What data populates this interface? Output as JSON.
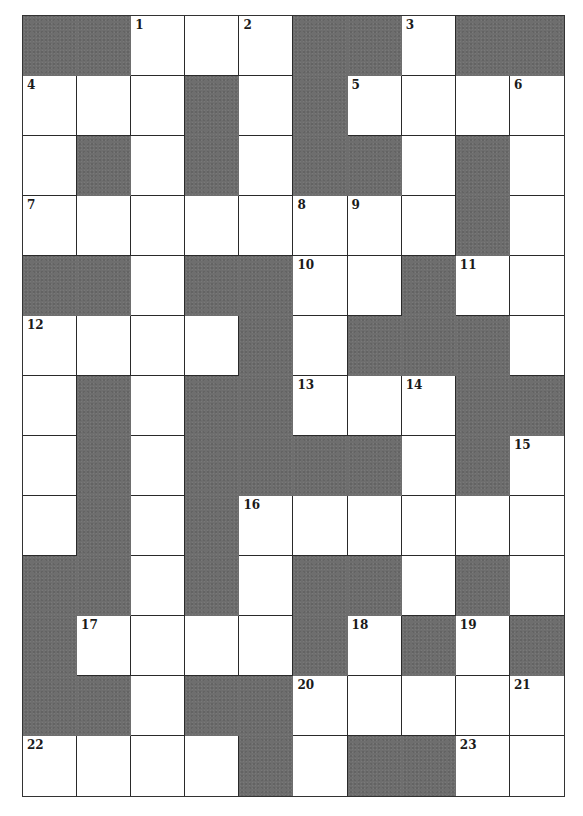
{
  "puzzle": {
    "type": "crossword",
    "columns": 10,
    "rows": 13,
    "colors": {
      "block": "#6e6e6e",
      "open": "#ffffff",
      "line": "#2a2a2a",
      "number": "#1a1a1a"
    },
    "legend": "# = black square, . = open square, number = numbered open square",
    "grid": [
      [
        "#",
        "#",
        "1",
        ".",
        "2",
        "#",
        "#",
        "3",
        "#",
        "#"
      ],
      [
        "4",
        ".",
        ".",
        "#",
        ".",
        "#",
        "5",
        ".",
        ".",
        "6"
      ],
      [
        ".",
        "#",
        ".",
        "#",
        ".",
        "#",
        "#",
        ".",
        "#",
        "."
      ],
      [
        "7",
        ".",
        ".",
        ".",
        ".",
        "8",
        "9",
        ".",
        "#",
        "."
      ],
      [
        "#",
        "#",
        ".",
        "#",
        "#",
        "10",
        ".",
        "#",
        "11",
        "."
      ],
      [
        "12",
        ".",
        ".",
        ".",
        "#",
        ".",
        "#",
        "#",
        "#",
        "."
      ],
      [
        ".",
        "#",
        ".",
        "#",
        "#",
        "13",
        ".",
        "14",
        "#",
        "#"
      ],
      [
        ".",
        "#",
        ".",
        "#",
        "#",
        "#",
        "#",
        ".",
        "#",
        "15"
      ],
      [
        ".",
        "#",
        ".",
        "#",
        "16",
        ".",
        ".",
        ".",
        ".",
        "."
      ],
      [
        "#",
        "#",
        ".",
        "#",
        ".",
        "#",
        "#",
        ".",
        "#",
        "."
      ],
      [
        "#",
        "17",
        ".",
        ".",
        ".",
        "#",
        "18",
        "#",
        "19",
        "#"
      ],
      [
        "#",
        "#",
        ".",
        "#",
        "#",
        "20",
        ".",
        ".",
        ".",
        "21"
      ],
      [
        "22",
        ".",
        ".",
        ".",
        "#",
        ".",
        "#",
        "#",
        "23",
        "."
      ]
    ],
    "clue_numbers": [
      "1",
      "2",
      "3",
      "4",
      "5",
      "6",
      "7",
      "8",
      "9",
      "10",
      "11",
      "12",
      "13",
      "14",
      "15",
      "16",
      "17",
      "18",
      "19",
      "20",
      "21",
      "22",
      "23"
    ]
  }
}
